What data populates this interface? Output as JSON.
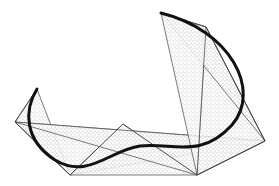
{
  "diagram": {
    "title": "",
    "colors": {
      "background": "#ffffff",
      "curve": "#111111",
      "polygon_edge": "#444444",
      "stipple": "#555555"
    },
    "control_polygon": [
      [
        37,
        89
      ],
      [
        15,
        122
      ],
      [
        70,
        175
      ],
      [
        123,
        124
      ],
      [
        197,
        175
      ],
      [
        265,
        141
      ],
      [
        206,
        27
      ],
      [
        161,
        13
      ]
    ],
    "hull_triangles": [
      [
        [
          37,
          89
        ],
        [
          15,
          122
        ],
        [
          70,
          175
        ]
      ],
      [
        [
          15,
          122
        ],
        [
          70,
          175
        ],
        [
          265,
          141
        ]
      ],
      [
        [
          70,
          175
        ],
        [
          123,
          124
        ],
        [
          197,
          175
        ]
      ],
      [
        [
          15,
          122
        ],
        [
          197,
          175
        ],
        [
          265,
          141
        ]
      ],
      [
        [
          197,
          175
        ],
        [
          265,
          141
        ],
        [
          206,
          27
        ]
      ],
      [
        [
          161,
          13
        ],
        [
          206,
          27
        ],
        [
          265,
          141
        ]
      ],
      [
        [
          197,
          175
        ],
        [
          206,
          27
        ],
        [
          161,
          13
        ]
      ]
    ],
    "curve_path": "M37,89 C24,110 24,140 55,160 C88,180 110,150 140,146 C172,142 200,160 232,125 C262,90 230,30 161,13"
  }
}
